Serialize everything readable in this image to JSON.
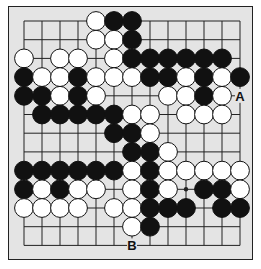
{
  "diagram": {
    "type": "go-board-fragment",
    "columns": 13,
    "rows": 13,
    "colors": {
      "background": "#e4e4e4",
      "line": "#222222",
      "black": "#111111",
      "white": "#ffffff"
    },
    "stones": [
      {
        "row": 0,
        "col": 4,
        "color": "white"
      },
      {
        "row": 0,
        "col": 5,
        "color": "black"
      },
      {
        "row": 0,
        "col": 6,
        "color": "black"
      },
      {
        "row": 1,
        "col": 4,
        "color": "white"
      },
      {
        "row": 1,
        "col": 5,
        "color": "white"
      },
      {
        "row": 1,
        "col": 6,
        "color": "black"
      },
      {
        "row": 2,
        "col": 0,
        "color": "white"
      },
      {
        "row": 2,
        "col": 2,
        "color": "white"
      },
      {
        "row": 2,
        "col": 3,
        "color": "white"
      },
      {
        "row": 2,
        "col": 5,
        "color": "white"
      },
      {
        "row": 2,
        "col": 6,
        "color": "black"
      },
      {
        "row": 2,
        "col": 7,
        "color": "black"
      },
      {
        "row": 2,
        "col": 8,
        "color": "black"
      },
      {
        "row": 2,
        "col": 9,
        "color": "black"
      },
      {
        "row": 2,
        "col": 10,
        "color": "black"
      },
      {
        "row": 2,
        "col": 11,
        "color": "black"
      },
      {
        "row": 3,
        "col": 0,
        "color": "black"
      },
      {
        "row": 3,
        "col": 1,
        "color": "white"
      },
      {
        "row": 3,
        "col": 2,
        "color": "white"
      },
      {
        "row": 3,
        "col": 3,
        "color": "black"
      },
      {
        "row": 3,
        "col": 4,
        "color": "white"
      },
      {
        "row": 3,
        "col": 5,
        "color": "white"
      },
      {
        "row": 3,
        "col": 6,
        "color": "white"
      },
      {
        "row": 3,
        "col": 7,
        "color": "black"
      },
      {
        "row": 3,
        "col": 8,
        "color": "black"
      },
      {
        "row": 3,
        "col": 9,
        "color": "white"
      },
      {
        "row": 3,
        "col": 10,
        "color": "black"
      },
      {
        "row": 3,
        "col": 11,
        "color": "white"
      },
      {
        "row": 3,
        "col": 12,
        "color": "black"
      },
      {
        "row": 4,
        "col": 0,
        "color": "black"
      },
      {
        "row": 4,
        "col": 1,
        "color": "black"
      },
      {
        "row": 4,
        "col": 2,
        "color": "white"
      },
      {
        "row": 4,
        "col": 3,
        "color": "black"
      },
      {
        "row": 4,
        "col": 4,
        "color": "white"
      },
      {
        "row": 4,
        "col": 8,
        "color": "white"
      },
      {
        "row": 4,
        "col": 9,
        "color": "white"
      },
      {
        "row": 4,
        "col": 10,
        "color": "black"
      },
      {
        "row": 4,
        "col": 11,
        "color": "white"
      },
      {
        "row": 5,
        "col": 1,
        "color": "black"
      },
      {
        "row": 5,
        "col": 2,
        "color": "black"
      },
      {
        "row": 5,
        "col": 3,
        "color": "black"
      },
      {
        "row": 5,
        "col": 4,
        "color": "black"
      },
      {
        "row": 5,
        "col": 5,
        "color": "black"
      },
      {
        "row": 5,
        "col": 6,
        "color": "white"
      },
      {
        "row": 5,
        "col": 7,
        "color": "white"
      },
      {
        "row": 5,
        "col": 9,
        "color": "white"
      },
      {
        "row": 5,
        "col": 10,
        "color": "white"
      },
      {
        "row": 5,
        "col": 11,
        "color": "white"
      },
      {
        "row": 6,
        "col": 5,
        "color": "black"
      },
      {
        "row": 6,
        "col": 6,
        "color": "black"
      },
      {
        "row": 6,
        "col": 7,
        "color": "white"
      },
      {
        "row": 7,
        "col": 6,
        "color": "black"
      },
      {
        "row": 7,
        "col": 7,
        "color": "black"
      },
      {
        "row": 7,
        "col": 8,
        "color": "white"
      },
      {
        "row": 8,
        "col": 0,
        "color": "black"
      },
      {
        "row": 8,
        "col": 1,
        "color": "black"
      },
      {
        "row": 8,
        "col": 2,
        "color": "black"
      },
      {
        "row": 8,
        "col": 3,
        "color": "black"
      },
      {
        "row": 8,
        "col": 4,
        "color": "black"
      },
      {
        "row": 8,
        "col": 5,
        "color": "black"
      },
      {
        "row": 8,
        "col": 6,
        "color": "white"
      },
      {
        "row": 8,
        "col": 7,
        "color": "black"
      },
      {
        "row": 8,
        "col": 8,
        "color": "white"
      },
      {
        "row": 8,
        "col": 9,
        "color": "white"
      },
      {
        "row": 8,
        "col": 10,
        "color": "white"
      },
      {
        "row": 8,
        "col": 11,
        "color": "white"
      },
      {
        "row": 8,
        "col": 12,
        "color": "white"
      },
      {
        "row": 9,
        "col": 0,
        "color": "black"
      },
      {
        "row": 9,
        "col": 1,
        "color": "white"
      },
      {
        "row": 9,
        "col": 2,
        "color": "black"
      },
      {
        "row": 9,
        "col": 3,
        "color": "white"
      },
      {
        "row": 9,
        "col": 4,
        "color": "white"
      },
      {
        "row": 9,
        "col": 6,
        "color": "white"
      },
      {
        "row": 9,
        "col": 7,
        "color": "black"
      },
      {
        "row": 9,
        "col": 8,
        "color": "white"
      },
      {
        "row": 9,
        "col": 10,
        "color": "black"
      },
      {
        "row": 9,
        "col": 11,
        "color": "black"
      },
      {
        "row": 9,
        "col": 12,
        "color": "white"
      },
      {
        "row": 10,
        "col": 0,
        "color": "white"
      },
      {
        "row": 10,
        "col": 1,
        "color": "white"
      },
      {
        "row": 10,
        "col": 2,
        "color": "white"
      },
      {
        "row": 10,
        "col": 3,
        "color": "white"
      },
      {
        "row": 10,
        "col": 5,
        "color": "white"
      },
      {
        "row": 10,
        "col": 6,
        "color": "white"
      },
      {
        "row": 10,
        "col": 7,
        "color": "black"
      },
      {
        "row": 10,
        "col": 8,
        "color": "black"
      },
      {
        "row": 10,
        "col": 9,
        "color": "black"
      },
      {
        "row": 10,
        "col": 11,
        "color": "black"
      },
      {
        "row": 10,
        "col": 12,
        "color": "black"
      },
      {
        "row": 11,
        "col": 6,
        "color": "white"
      },
      {
        "row": 11,
        "col": 7,
        "color": "black"
      }
    ],
    "star_points": [
      {
        "row": 9,
        "col": 9
      }
    ],
    "labels": [
      {
        "row": 4,
        "col": 12,
        "text": "A"
      },
      {
        "row": 12,
        "col": 6,
        "text": "B"
      }
    ]
  }
}
